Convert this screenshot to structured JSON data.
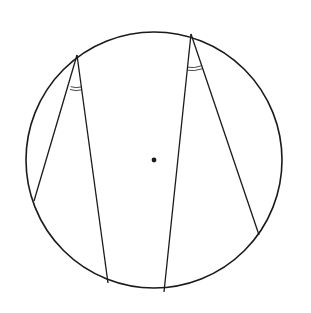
{
  "diagram": {
    "type": "geometry",
    "circle": {
      "cx": 154,
      "cy": 160,
      "r": 128,
      "stroke": "#1a1a1a",
      "stroke_width": 1.6
    },
    "center_dot": {
      "x": 154,
      "y": 160,
      "r": 2.4,
      "fill": "#1a1a1a"
    },
    "points": {
      "A": {
        "x": 77,
        "y": 55
      },
      "B": {
        "x": 34,
        "y": 201
      },
      "C": {
        "x": 108,
        "y": 283
      },
      "D": {
        "x": 191,
        "y": 34
      },
      "E": {
        "x": 164,
        "y": 292
      },
      "F": {
        "x": 259,
        "y": 235
      }
    },
    "segments": [
      {
        "from": "A",
        "to": "B"
      },
      {
        "from": "A",
        "to": "C"
      },
      {
        "from": "D",
        "to": "E"
      },
      {
        "from": "D",
        "to": "F"
      }
    ],
    "angle_marks": [
      {
        "vertex": "A",
        "between": [
          "B",
          "C"
        ],
        "arcs": 2
      },
      {
        "vertex": "D",
        "between": [
          "E",
          "F"
        ],
        "arcs": 2
      }
    ],
    "line_color": "#1a1a1a"
  }
}
